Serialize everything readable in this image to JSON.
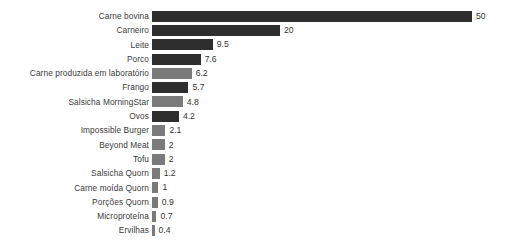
{
  "chart_data": {
    "type": "bar",
    "orientation": "horizontal",
    "title": "",
    "subtitle": "",
    "xlabel": "",
    "ylabel": "",
    "xlim": [
      0,
      50
    ],
    "grid": false,
    "legend": "none",
    "axis_visible": false,
    "categories": [
      "Carne bovina",
      "Carneiro",
      "Leite",
      "Porco",
      "Carne produzida em laboratório",
      "Frango",
      "Salsicha MorningStar",
      "Ovos",
      "Impossible Burger",
      "Beyond Meat",
      "Tofu",
      "Salsicha Quorn",
      "Carne moída Quorn",
      "Porções Quorn",
      "Microproteína",
      "Ervilhas"
    ],
    "values": [
      50,
      20,
      9.5,
      7.6,
      6.2,
      5.7,
      4.8,
      4.2,
      2.1,
      2,
      2,
      1.2,
      1,
      0.9,
      0.7,
      0.4
    ],
    "value_labels": [
      "50",
      "20",
      "9.5",
      "7.6",
      "6.2",
      "5.7",
      "4.8",
      "4.2",
      "2.1",
      "2",
      "2",
      "1.2",
      "1",
      "0.9",
      "0.7",
      "0.4"
    ],
    "bar_colors": [
      "dark",
      "dark",
      "dark",
      "dark",
      "light",
      "dark",
      "light",
      "dark",
      "light",
      "light",
      "light",
      "light",
      "light",
      "light",
      "light",
      "light"
    ],
    "colors": {
      "dark": "#2e2e2e",
      "light": "#7a7a7a",
      "background": "#ffffff",
      "label_text": "#3a3a3a",
      "value_text": "#333333"
    },
    "bars": [
      {
        "category": "Carne bovina",
        "value": 50,
        "label": "50",
        "color": "dark"
      },
      {
        "category": "Carneiro",
        "value": 20,
        "label": "20",
        "color": "dark"
      },
      {
        "category": "Leite",
        "value": 9.5,
        "label": "9.5",
        "color": "dark"
      },
      {
        "category": "Porco",
        "value": 7.6,
        "label": "7.6",
        "color": "dark"
      },
      {
        "category": "Carne produzida em laboratório",
        "value": 6.2,
        "label": "6.2",
        "color": "light"
      },
      {
        "category": "Frango",
        "value": 5.7,
        "label": "5.7",
        "color": "dark"
      },
      {
        "category": "Salsicha MorningStar",
        "value": 4.8,
        "label": "4.8",
        "color": "light"
      },
      {
        "category": "Ovos",
        "value": 4.2,
        "label": "4.2",
        "color": "dark"
      },
      {
        "category": "Impossible Burger",
        "value": 2.1,
        "label": "2.1",
        "color": "light"
      },
      {
        "category": "Beyond Meat",
        "value": 2,
        "label": "2",
        "color": "light"
      },
      {
        "category": "Tofu",
        "value": 2,
        "label": "2",
        "color": "light"
      },
      {
        "category": "Salsicha Quorn",
        "value": 1.2,
        "label": "1.2",
        "color": "light"
      },
      {
        "category": "Carne moída Quorn",
        "value": 1,
        "label": "1",
        "color": "light"
      },
      {
        "category": "Porções Quorn",
        "value": 0.9,
        "label": "0.9",
        "color": "light"
      },
      {
        "category": "Microproteína",
        "value": 0.7,
        "label": "0.7",
        "color": "light"
      },
      {
        "category": "Ervilhas",
        "value": 0.4,
        "label": "0.4",
        "color": "light"
      }
    ]
  }
}
